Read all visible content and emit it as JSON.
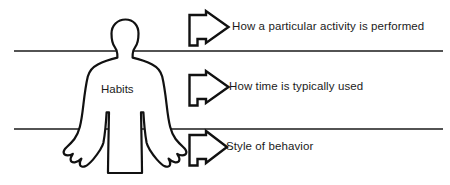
{
  "diagram": {
    "background_color": "#ffffff",
    "stroke_color": "#111111",
    "text_color": "#1b1b1b",
    "figure": {
      "name": "human-silhouette",
      "label": "Habits"
    },
    "dividers": [
      {
        "name": "divider-line-top",
        "y": 51
      },
      {
        "name": "divider-line-bottom",
        "y": 129
      }
    ],
    "callouts": [
      {
        "id": "callout-1",
        "arrow": "right-arrow",
        "text": "How a particular activity is performed"
      },
      {
        "id": "callout-2",
        "arrow": "right-arrow",
        "text": "How time is typically used"
      },
      {
        "id": "callout-3",
        "arrow": "right-arrow",
        "text": "Style of behavior"
      }
    ]
  }
}
